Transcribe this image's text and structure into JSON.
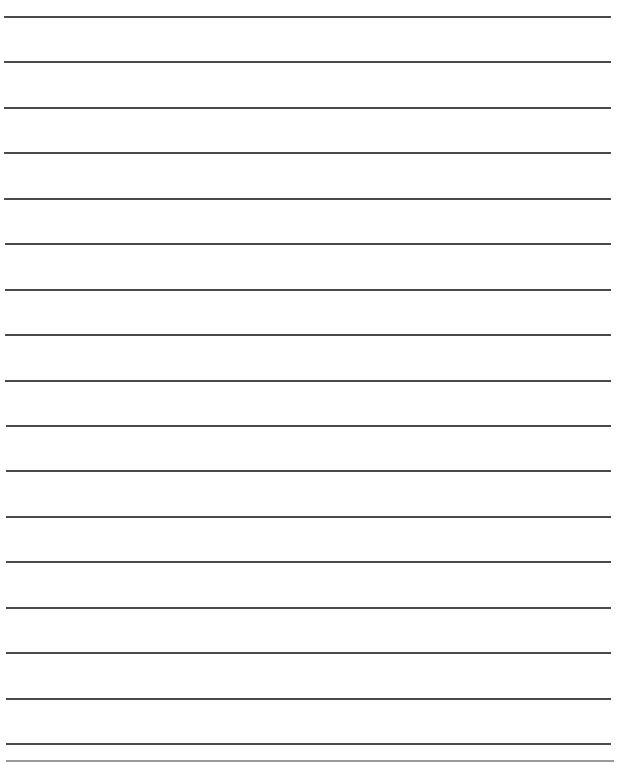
{
  "page": {
    "type": "lined-paper",
    "background": "#ffffff",
    "line_color": "#4a4a4a",
    "bottom_border_color": "#9a9a9a",
    "rules": [
      {
        "y": 16,
        "x1": 4,
        "x2": 611
      },
      {
        "y": 61,
        "x1": 4,
        "x2": 611
      },
      {
        "y": 107,
        "x1": 4,
        "x2": 611
      },
      {
        "y": 152,
        "x1": 4,
        "x2": 611
      },
      {
        "y": 198,
        "x1": 4,
        "x2": 611
      },
      {
        "y": 243,
        "x1": 5,
        "x2": 611
      },
      {
        "y": 289,
        "x1": 5,
        "x2": 611
      },
      {
        "y": 334,
        "x1": 5,
        "x2": 611
      },
      {
        "y": 380,
        "x1": 5,
        "x2": 611
      },
      {
        "y": 425,
        "x1": 6,
        "x2": 611
      },
      {
        "y": 470,
        "x1": 6,
        "x2": 611
      },
      {
        "y": 516,
        "x1": 6,
        "x2": 611
      },
      {
        "y": 561,
        "x1": 6,
        "x2": 611
      },
      {
        "y": 607,
        "x1": 6,
        "x2": 611
      },
      {
        "y": 652,
        "x1": 6,
        "x2": 611
      },
      {
        "y": 698,
        "x1": 6,
        "x2": 611
      },
      {
        "y": 743,
        "x1": 6,
        "x2": 611
      }
    ],
    "bottom_border": {
      "y": 760,
      "x1": 6,
      "x2": 614
    }
  }
}
